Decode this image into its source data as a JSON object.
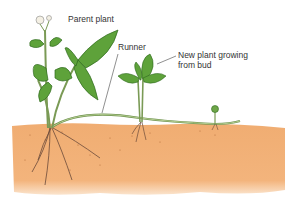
{
  "diagram": {
    "labels": {
      "parent_plant": "Parent plant",
      "runner": "Runner",
      "new_plant_line1": "New plant growing",
      "new_plant_line2": "from bud"
    },
    "colors": {
      "soil": "#f0ad72",
      "soil_dark": "#d98c4f",
      "leaf": "#5ea23a",
      "leaf_dark": "#2f6a1e",
      "stem": "#8fae6a",
      "root": "#6b4a3a",
      "label_text": "#333333"
    }
  }
}
